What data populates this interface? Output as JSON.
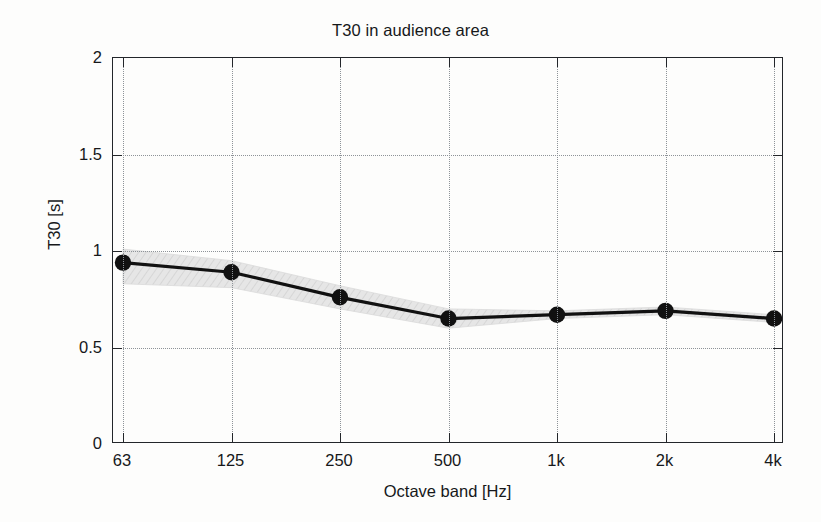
{
  "chart_data": {
    "type": "line",
    "title": "T30 in audience area",
    "xlabel": "Octave band [Hz]",
    "ylabel": "T30 [s]",
    "categories": [
      "63",
      "125",
      "250",
      "500",
      "1k",
      "2k",
      "4k"
    ],
    "values": [
      0.94,
      0.89,
      0.76,
      0.65,
      0.67,
      0.69,
      0.65
    ],
    "series": [
      {
        "name": "T30",
        "values": [
          0.94,
          0.89,
          0.76,
          0.65,
          0.67,
          0.69,
          0.65
        ],
        "marker": "filled-circle",
        "color": "#111111"
      }
    ],
    "band": {
      "name": "spatial spread",
      "upper": [
        1.01,
        0.95,
        0.82,
        0.7,
        0.69,
        0.71,
        0.67
      ],
      "lower": [
        0.83,
        0.81,
        0.7,
        0.6,
        0.65,
        0.67,
        0.63
      ],
      "color": "#e3e3e3",
      "hatched": true
    },
    "ylim": [
      0,
      2
    ],
    "yticks": [
      0,
      0.5,
      1,
      1.5,
      2
    ],
    "ytick_labels": [
      "0",
      "0.5",
      "1",
      "1.5",
      "2"
    ],
    "xticks": [
      "63",
      "125",
      "250",
      "500",
      "1k",
      "2k",
      "4k"
    ],
    "grid": true,
    "grid_style": "dotted",
    "legend": null,
    "legend_position": "none"
  },
  "figure": {
    "background_color": "#fdfdfc",
    "axis_color": "#23262a",
    "grid_color": "#8e9398",
    "text_color": "#16181a"
  }
}
